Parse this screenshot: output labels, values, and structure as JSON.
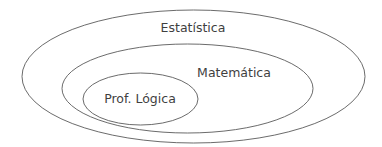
{
  "diagram": {
    "type": "nested-sets",
    "sets": [
      {
        "label": "Estatística",
        "level": 0
      },
      {
        "label": "Matemática",
        "level": 1
      },
      {
        "label": "Prof. Lógica",
        "level": 2
      }
    ],
    "colors": {
      "stroke": "#5a5a5a",
      "text": "#3f3f3f",
      "background": "#ffffff"
    }
  }
}
